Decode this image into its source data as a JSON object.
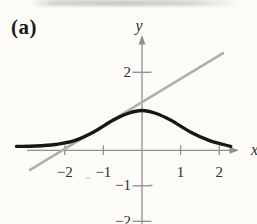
{
  "figure": {
    "label": "(a)"
  },
  "chart_data": {
    "type": "line",
    "title": "(a)",
    "xlabel": "x",
    "ylabel": "y",
    "xlim": [
      -3.3,
      2.6
    ],
    "ylim": [
      -2.1,
      3.0
    ],
    "grid": false,
    "legend": "none",
    "axis_color": "#8f8f8d",
    "label_color": "#2e2e2c",
    "x_ticks": [
      {
        "value": -2,
        "label": "−2"
      },
      {
        "value": -1,
        "label": "−1"
      },
      {
        "value": 1,
        "label": "1"
      },
      {
        "value": 2,
        "label": "2"
      }
    ],
    "y_ticks": [
      {
        "value": 2,
        "label": "2"
      },
      {
        "value": -1,
        "label": "−1"
      },
      {
        "value": -2,
        "label": "−2"
      }
    ],
    "series": [
      {
        "name": "bell-shaped-curve",
        "shape": "smooth",
        "color": "#171715",
        "width": 3.3,
        "x": [
          -3.25,
          -2.75,
          -2.25,
          -1.75,
          -1.25,
          -0.75,
          -0.35,
          0,
          0.35,
          0.75,
          1.25,
          1.75,
          2.3
        ],
        "y": [
          0.1,
          0.11,
          0.15,
          0.25,
          0.47,
          0.77,
          0.95,
          1.02,
          0.95,
          0.77,
          0.47,
          0.25,
          0.1
        ]
      },
      {
        "name": "tangent-line",
        "shape": "straight",
        "color": "#b1afab",
        "width": 2.6,
        "x": [
          -2.9,
          2.1
        ],
        "y": [
          -0.55,
          2.49
        ]
      }
    ]
  }
}
